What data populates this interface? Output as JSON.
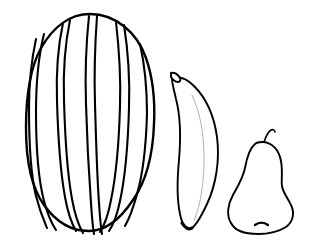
{
  "scene": {
    "title": "Fruit Line Drawing",
    "description": "Black and white outline drawing of three fruits",
    "width": 309,
    "height": 246,
    "background_color": "#ffffff",
    "line_color": "#000000",
    "faint_line_color": "#b9b9b9",
    "style": "line-art"
  },
  "objects": [
    {
      "id": "watermelon",
      "label": "Watermelon",
      "icon": "watermelon-icon",
      "order": 1,
      "position": "left",
      "size": "large",
      "bbox": [
        25,
        13,
        130,
        222
      ],
      "stroke_width": 2.2,
      "stripe_count": 8,
      "has_stripes": true,
      "body_path": "M 90 14 C 115 14 137 32 146 58 C 153 78 155 104 154 124 C 153 152 147 180 133 200 C 119 221 104 231 89 231 C 72 231 56 222 44 205 C 31 187 26 160 26 128 C 26 98 29 70 41 48 C 53 27 70 14 90 14 Z",
      "stripes": [
        "M 36 39 C 31 62 29 84 29 108 C 29 140 30 172 36 196 C 40 212 44 221 47 228",
        "M 44 34 C 38 58 36 86 36 112 C 36 146 38 178 44 201 C 48 216 52 224 56 230",
        "M 63 23 C 58 46 56 72 57 101 C 58 135 60 170 65 197 C 68 214 72 224 76 231",
        "M 70 20 C 65 44 63 70 64 100 C 65 136 67 172 72 199 C 75 216 79 226 83 233",
        "M 89 16 C 86 44 85 74 86 104 C 87 140 89 176 91 203 C 92 219 93 228 94 234",
        "M 97 16 C 95 44 94 74 95 104 C 96 140 97 176 99 203 C 100 219 101 228 102 234",
        "M 116 22 C 119 48 121 76 120 106 C 119 142 116 176 111 200 C 108 216 104 226 100 232",
        "M 124 25 C 128 50 130 78 129 108 C 128 144 125 178 120 201 C 117 216 113 225 109 231",
        "M 140 44 C 145 66 147 90 147 114 C 146 146 143 174 137 194 C 133 209 129 219 125 226"
      ]
    },
    {
      "id": "banana",
      "label": "Banana",
      "icon": "banana-icon",
      "order": 2,
      "position": "center",
      "size": "medium",
      "bbox": [
        168,
        71,
        52,
        160
      ],
      "stroke_width": 1.8,
      "has_stem": true,
      "has_inner_line": true,
      "body_path": "M 172 79 C 178 76 186 78 194 86 C 205 97 214 115 217 137 C 220 160 216 185 207 204 C 200 219 194 228 190 229 C 186 230 182 224 180 214 C 177 200 177 181 179 160 C 181 136 180 114 176 99 C 174 90 172 83 172 79 Z",
      "stem_path": "M 171 73 C 174 72 178 74 180 78 C 181 80 180 82 178 82 C 176 82 173 80 171 77 Z",
      "tip_path": "M 182 223 C 185 228 189 230 192 228",
      "inner_line_path": "M 192 95 C 200 112 204 135 204 158 C 204 182 200 206 194 221"
    },
    {
      "id": "pear",
      "label": "Pear",
      "icon": "pear-icon",
      "order": 3,
      "position": "right",
      "size": "small",
      "bbox": [
        229,
        131,
        64,
        100
      ],
      "stroke_width": 1.8,
      "has_stem": true,
      "has_calyx": true,
      "body_path": "M 262 142 C 272 142 279 150 281 161 C 283 172 281 180 282 186 C 283 193 288 198 291 205 C 295 213 293 222 286 227 C 278 232 266 234 258 234 C 246 234 235 231 231 223 C 226 215 228 204 233 195 C 238 186 243 178 245 168 C 247 157 250 148 255 144 C 257 142 259 142 262 142 Z",
      "stem_path": "M 264 142 C 266 136 268 132 271 130 C 273 129 275 130 275 132",
      "calyx_path": "M 255 225 C 259 222 264 222 268 225"
    }
  ]
}
